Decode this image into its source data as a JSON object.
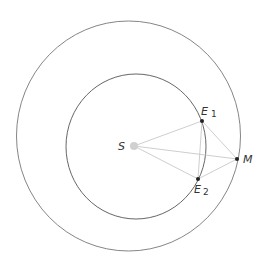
{
  "diagram": {
    "type": "orbital-geometry",
    "orbits": [
      {
        "name": "outer-orbit",
        "cx": 128.5,
        "cy": 136,
        "rx": 112,
        "ry": 115
      },
      {
        "name": "inner-orbit",
        "cx": 136,
        "cy": 146.5,
        "rx": 70,
        "ry": 72.5
      }
    ],
    "points": {
      "S": {
        "label": "S",
        "x": 134,
        "y": 146
      },
      "E1": {
        "label": "E",
        "sub": "1",
        "x": 202,
        "y": 121
      },
      "E2": {
        "label": "E",
        "sub": "2",
        "x": 198,
        "y": 179
      },
      "M": {
        "label": "M",
        "x": 237,
        "y": 159
      }
    },
    "colors": {
      "orbit": "#666666",
      "lines": "#c8c8c8",
      "sun": "#d0d0d0",
      "planet": "#222222"
    }
  }
}
